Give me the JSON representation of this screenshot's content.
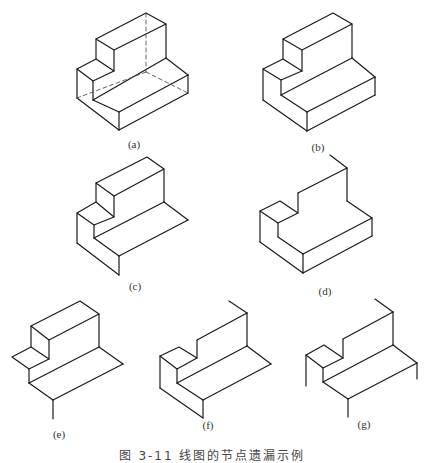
{
  "figure": {
    "caption": "图 3-11  线图的节点遗漏示例",
    "subfigures": [
      {
        "id": "a",
        "label": "(a)",
        "description": "Complete isometric drawing of an L-shaped stepped block with hidden (dashed) edges"
      },
      {
        "id": "b",
        "label": "(b)",
        "description": "Same block drawn with visible edges only"
      },
      {
        "id": "c",
        "label": "(c)",
        "description": "Line drawing with missing right-front base edges"
      },
      {
        "id": "d",
        "label": "(d)",
        "description": "Line drawing with missing top edges of the tall block"
      },
      {
        "id": "e",
        "label": "(e)",
        "description": "Line drawing with missing front-left and bottom edges"
      },
      {
        "id": "f",
        "label": "(f)",
        "description": "Line drawing with missing top and right edges"
      },
      {
        "id": "g",
        "label": "(g)",
        "description": "Line drawing with many missing junctions, only fragments remaining"
      }
    ]
  },
  "colors": {
    "line": "#1a1a1a",
    "hidden_line": "#555555",
    "background": "#ffffff"
  }
}
